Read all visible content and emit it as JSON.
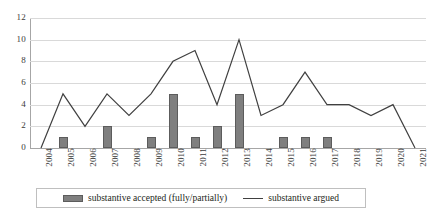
{
  "chart_data": {
    "type": "bar",
    "title": "",
    "subtitle": "",
    "xlabel": "",
    "ylabel": "",
    "categories": [
      "2004",
      "2005",
      "2006",
      "2007",
      "2008",
      "2009",
      "2010",
      "2011",
      "2012",
      "2013",
      "2014",
      "2015",
      "2016",
      "2017",
      "2018",
      "2019",
      "2020",
      "2021"
    ],
    "series": [
      {
        "name": "substantive accepted (fully/partially)",
        "type": "bar",
        "color": "#7f7f7f",
        "values": [
          0,
          1,
          0,
          2,
          0,
          1,
          5,
          1,
          2,
          5,
          0,
          1,
          1,
          1,
          0,
          0,
          0,
          0
        ]
      },
      {
        "name": "substantive argued",
        "type": "line",
        "color": "#404040",
        "values": [
          0,
          5,
          2,
          5,
          3,
          5,
          8,
          9,
          4,
          10,
          3,
          4,
          7,
          4,
          4,
          3,
          4,
          0
        ]
      }
    ],
    "ylim": [
      0,
      12
    ],
    "ytick_labels": [
      "0",
      "2",
      "4",
      "6",
      "8",
      "10",
      "12"
    ],
    "ytick_values": [
      0,
      2,
      4,
      6,
      8,
      10,
      12
    ],
    "grid": true,
    "legend_position": "bottom"
  },
  "legend": {
    "entries": [
      {
        "label": "substantive accepted (fully/partially)",
        "marker": "bar-swatch-icon"
      },
      {
        "label": "substantive argued",
        "marker": "line-swatch-icon"
      }
    ]
  }
}
